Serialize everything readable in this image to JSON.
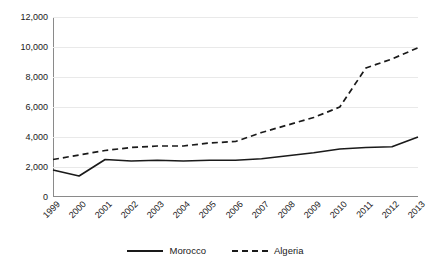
{
  "chart_data": {
    "type": "line",
    "title": "",
    "xlabel": "",
    "ylabel": "",
    "categories": [
      "1999",
      "2000",
      "2001",
      "2002",
      "2003",
      "2004",
      "2005",
      "2006",
      "2007",
      "2008",
      "2009",
      "2010",
      "2011",
      "2012",
      "2013"
    ],
    "ylim": [
      0,
      12000
    ],
    "ytick_labels": [
      "12,000",
      "10,000",
      "8,000",
      "6,000",
      "4,000",
      "2,000",
      "0"
    ],
    "ytick_values": [
      12000,
      10000,
      8000,
      6000,
      4000,
      2000,
      0
    ],
    "grid": true,
    "legend_position": "bottom-center",
    "series": [
      {
        "name": "Morocco",
        "style": "solid",
        "color": "#1a1a1a",
        "values": [
          1800,
          1400,
          2500,
          2400,
          2450,
          2400,
          2450,
          2450,
          2550,
          2750,
          2950,
          3200,
          3300,
          3350,
          4000
        ]
      },
      {
        "name": "Algeria",
        "style": "dashed",
        "color": "#1a1a1a",
        "values": [
          2500,
          2800,
          3100,
          3300,
          3400,
          3400,
          3600,
          3700,
          4300,
          4800,
          5300,
          6000,
          8600,
          9200,
          9950
        ]
      }
    ]
  },
  "legend": {
    "items": [
      {
        "label": "Morocco",
        "style": "solid"
      },
      {
        "label": "Algeria",
        "style": "dashed"
      }
    ]
  }
}
